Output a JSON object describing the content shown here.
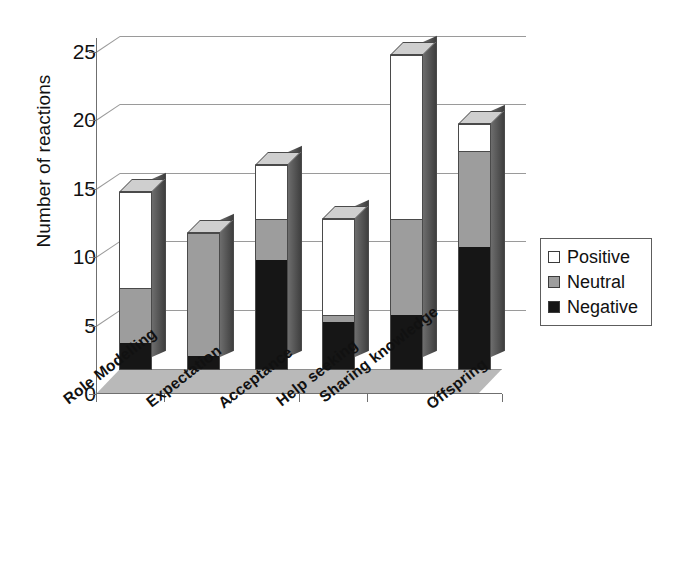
{
  "chart_data": {
    "type": "bar",
    "subtype": "stacked-3d-column",
    "title": "",
    "xlabel": "",
    "ylabel": "Number of reactions",
    "ylim": [
      0,
      26
    ],
    "yticks": [
      0,
      5,
      10,
      15,
      20,
      25
    ],
    "grid": true,
    "legend_position": "right",
    "categories": [
      "Role Modelling",
      "Expectation",
      "Acceptance",
      "Help seeking",
      "Sharing knowledge",
      "Offspring"
    ],
    "series": [
      {
        "name": "Negative",
        "color": "#161616",
        "values": [
          2,
          1,
          8,
          3.5,
          4,
          9
        ]
      },
      {
        "name": "Neutral",
        "color": "#9d9d9d",
        "values": [
          4,
          9,
          3,
          0.5,
          7,
          7
        ]
      },
      {
        "name": "Positive",
        "color": "#ffffff",
        "values": [
          7,
          0,
          4,
          7,
          12,
          2
        ]
      }
    ],
    "totals": [
      13,
      10,
      15,
      11,
      23,
      18
    ]
  },
  "axis": {
    "y_title": "Number of reactions",
    "y_ticks": [
      "0",
      "5",
      "10",
      "15",
      "20",
      "25"
    ]
  },
  "legend": {
    "items": [
      {
        "label": "Positive",
        "color": "#ffffff"
      },
      {
        "label": "Neutral",
        "color": "#9d9d9d"
      },
      {
        "label": "Negative",
        "color": "#161616"
      }
    ]
  }
}
